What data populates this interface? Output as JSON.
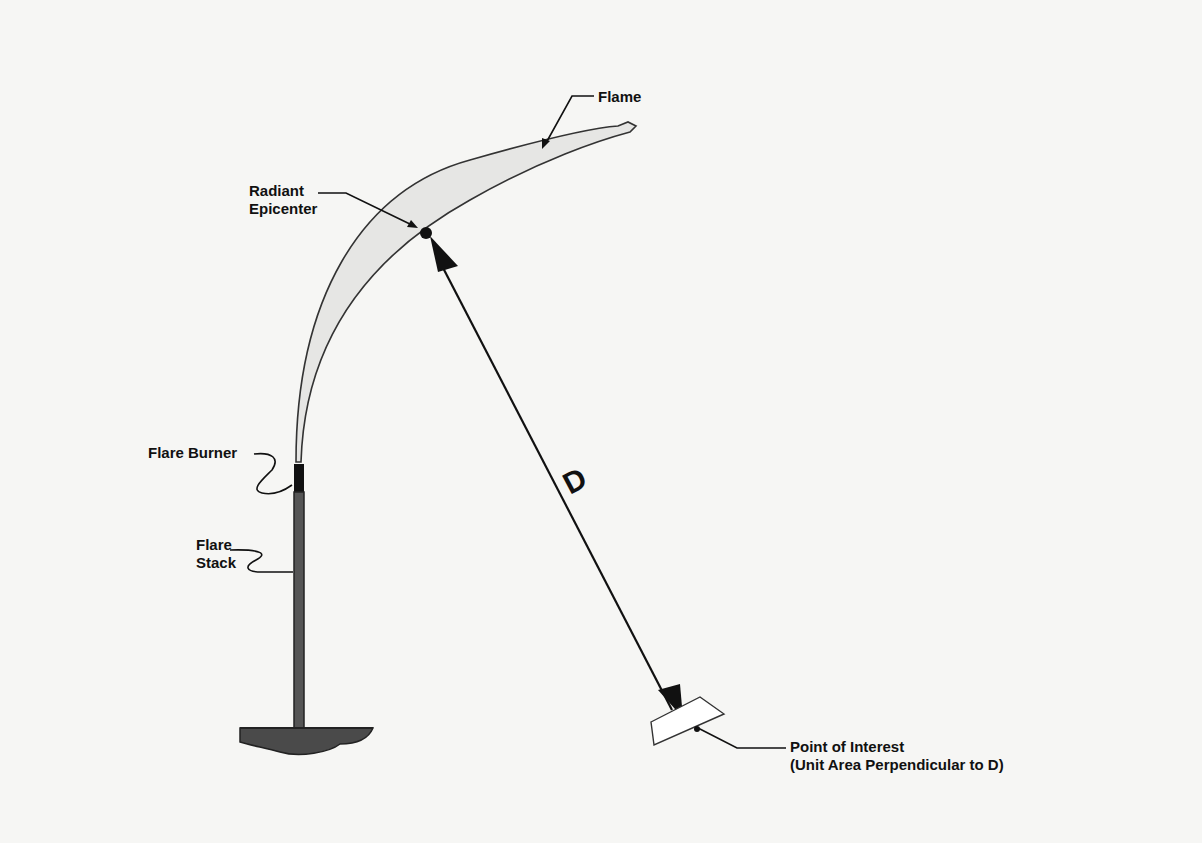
{
  "diagram": {
    "labels": {
      "flame": "Flame",
      "radiant_line1": "Radiant",
      "radiant_line2": "Epicenter",
      "burner": "Flare Burner",
      "stack_line1": "Flare",
      "stack_line2": "Stack",
      "distance": "D",
      "poi_line1": "Point of Interest",
      "poi_line2": "(Unit Area Perpendicular to D)"
    },
    "colors": {
      "background": "#f6f6f4",
      "ink": "#111111",
      "flame_fill": "#e6e6e4",
      "stack": "#555555",
      "ground": "#4a4a4a"
    }
  }
}
